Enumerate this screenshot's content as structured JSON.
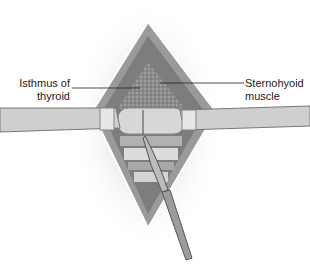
{
  "figure": {
    "labels": [
      {
        "id": "isthmus",
        "line1": "Isthmus of",
        "line2": "thyroid"
      },
      {
        "id": "sternohyoid",
        "line1": "Sternohyoid",
        "line2": "muscle"
      }
    ]
  }
}
